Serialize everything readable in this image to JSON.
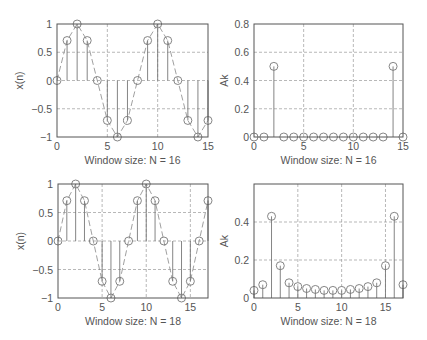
{
  "chart_data": [
    {
      "type": "stem",
      "id": "top-left",
      "title": "",
      "xlabel": "Window size: N = 16",
      "ylabel": "x(n)",
      "xlim": [
        0,
        15
      ],
      "ylim": [
        -1,
        1
      ],
      "xticks": [
        0,
        5,
        10,
        15
      ],
      "yticks": [
        -1,
        -0.5,
        0,
        0.5,
        1
      ],
      "ytick_labels": [
        "−1",
        "−0.5",
        "0",
        "0.5",
        "1"
      ],
      "grid": true,
      "dashed_envelope": true,
      "x": [
        0,
        1,
        2,
        3,
        4,
        5,
        6,
        7,
        8,
        9,
        10,
        11,
        12,
        13,
        14,
        15
      ],
      "values": [
        0,
        0.707,
        1,
        0.707,
        0,
        -0.707,
        -1,
        -0.707,
        0,
        0.707,
        1,
        0.707,
        0,
        -0.707,
        -1,
        -0.707
      ],
      "box": {
        "left": 57,
        "top": 24,
        "right": 208,
        "bottom": 137
      }
    },
    {
      "type": "stem",
      "id": "top-right",
      "title": "",
      "xlabel": "Window size: N = 16",
      "ylabel": "Ak",
      "xlim": [
        0,
        15
      ],
      "ylim": [
        0,
        0.8
      ],
      "xticks": [
        0,
        5,
        10,
        15
      ],
      "yticks": [
        0,
        0.2,
        0.4,
        0.6,
        0.8
      ],
      "ytick_labels": [
        "0",
        "0.2",
        "0.4",
        "0.6",
        "0.8"
      ],
      "grid": true,
      "dashed_envelope": false,
      "x": [
        0,
        1,
        2,
        3,
        4,
        5,
        6,
        7,
        8,
        9,
        10,
        11,
        12,
        13,
        14,
        15
      ],
      "values": [
        0,
        0,
        0.5,
        0,
        0,
        0,
        0,
        0,
        0,
        0,
        0,
        0,
        0,
        0,
        0.5,
        0
      ],
      "box": {
        "left": 254,
        "top": 24,
        "right": 403,
        "bottom": 137
      }
    },
    {
      "type": "stem",
      "id": "bottom-left",
      "title": "",
      "xlabel": "Window size: N = 18",
      "ylabel": "x(n)",
      "xlim": [
        0,
        17
      ],
      "ylim": [
        -1,
        1
      ],
      "xticks": [
        0,
        5,
        10,
        15
      ],
      "yticks": [
        -1,
        -0.5,
        0,
        0.5,
        1
      ],
      "ytick_labels": [
        "−1",
        "−0.5",
        "0",
        "0.5",
        "1"
      ],
      "grid": true,
      "dashed_envelope": true,
      "x": [
        0,
        1,
        2,
        3,
        4,
        5,
        6,
        7,
        8,
        9,
        10,
        11,
        12,
        13,
        14,
        15,
        16,
        17
      ],
      "values": [
        0,
        0.707,
        1,
        0.707,
        0,
        -0.707,
        -1,
        -0.707,
        0,
        0.707,
        1,
        0.707,
        0,
        -0.707,
        -1,
        -0.707,
        0,
        0.707
      ],
      "box": {
        "left": 58,
        "top": 184,
        "right": 208,
        "bottom": 298
      }
    },
    {
      "type": "stem",
      "id": "bottom-right",
      "title": "",
      "xlabel": "Window size: N = 18",
      "ylabel": "Ak",
      "xlim": [
        0,
        17
      ],
      "ylim": [
        0,
        0.6
      ],
      "xticks": [
        0,
        5,
        10,
        15
      ],
      "yticks": [
        0,
        0.2,
        0.4
      ],
      "ytick_labels": [
        "0",
        "0.2",
        "0.4"
      ],
      "grid": true,
      "dashed_envelope": false,
      "x": [
        0,
        1,
        2,
        3,
        4,
        5,
        6,
        7,
        8,
        9,
        10,
        11,
        12,
        13,
        14,
        15,
        16,
        17
      ],
      "values": [
        0.04,
        0.07,
        0.43,
        0.17,
        0.08,
        0.06,
        0.05,
        0.045,
        0.04,
        0.04,
        0.04,
        0.045,
        0.05,
        0.06,
        0.08,
        0.17,
        0.43,
        0.07
      ],
      "box": {
        "left": 254,
        "top": 184,
        "right": 403,
        "bottom": 298
      }
    }
  ]
}
